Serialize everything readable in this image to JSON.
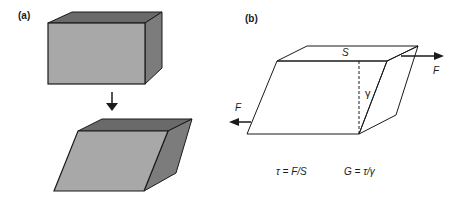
{
  "panel_a": {
    "label": "(a)",
    "arrow_icon": "down-arrow-icon"
  },
  "panel_b": {
    "label": "(b)",
    "area_label": "S",
    "strain_label": "γ",
    "force_right_label": "F",
    "force_left_label": "F",
    "equation_stress": "τ = F/S",
    "equation_modulus": "G = τ/γ"
  },
  "colors": {
    "front_face": "#a8a8a8",
    "top_face": "#6a6a6a",
    "side_face": "#7c7c7c",
    "line": "#1a1a1a"
  }
}
